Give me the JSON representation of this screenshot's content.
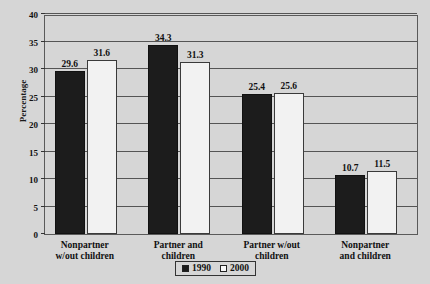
{
  "chart_data": {
    "type": "bar",
    "title": "",
    "xlabel": "",
    "ylabel": "Percentage",
    "ylim": [
      0,
      40
    ],
    "ytick_step": 5,
    "yticks": [
      "0",
      "5",
      "10",
      "15",
      "20",
      "25",
      "30",
      "35",
      "40"
    ],
    "grid": true,
    "legend_position": "bottom-center",
    "categories": [
      "Nonpartner w/out children",
      "Partner and children",
      "Partner w/out children",
      "Nonpartner and children"
    ],
    "category_lines": [
      [
        "Nonpartner",
        "w/out children"
      ],
      [
        "Partner and",
        "children"
      ],
      [
        "Partner w/out",
        "children"
      ],
      [
        "Nonpartner",
        "and children"
      ]
    ],
    "series": [
      {
        "name": "1990",
        "color": "#1c1c1c",
        "values": [
          29.6,
          34.3,
          25.4,
          10.7
        ],
        "labels": [
          "29.6",
          "34.3",
          "25.4",
          "10.7"
        ]
      },
      {
        "name": "2000",
        "color": "#f2f2f2",
        "values": [
          31.6,
          31.3,
          25.6,
          11.5
        ],
        "labels": [
          "31.6",
          "31.3",
          "25.6",
          "11.5"
        ]
      }
    ]
  },
  "legend": {
    "entries": [
      {
        "label": "1990",
        "swatch": "filled-dark-square"
      },
      {
        "label": "2000",
        "swatch": "empty-white-square"
      }
    ]
  },
  "axis": {
    "y_title": "Percentage"
  }
}
